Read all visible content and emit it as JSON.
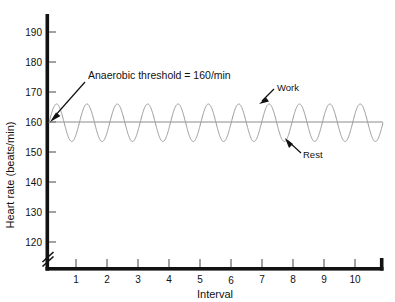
{
  "figure": {
    "background_color": "#ffffff",
    "width": 395,
    "height": 302,
    "truncated_title": ""
  },
  "chart_data": {
    "type": "line",
    "title": "",
    "xlabel": "Interval",
    "ylabel": "Heart rate (beats/min)",
    "xlim": [
      0,
      11
    ],
    "ylim": [
      115,
      195
    ],
    "y_axis_break": true,
    "y_axis_break_below": 120,
    "grid": false,
    "legend": false,
    "x_ticks": [
      1,
      2,
      3,
      4,
      5,
      6,
      7,
      8,
      9,
      10
    ],
    "x_tick_labels": [
      "1",
      "2",
      "3",
      "4",
      "5",
      "6",
      "7",
      "8",
      "9",
      "10"
    ],
    "y_ticks": [
      120,
      130,
      140,
      150,
      160,
      170,
      180,
      190
    ],
    "y_tick_labels": [
      "120",
      "130",
      "140",
      "150",
      "160",
      "170",
      "180",
      "190"
    ],
    "series": [
      {
        "name": "Heart rate during interval training",
        "type": "oscillating",
        "color": "#9a9a9a",
        "mean": 160,
        "peak_value": 166,
        "trough_value": 153.5,
        "cycles": 11,
        "description": "Sinusoidal heart rate alternating between work peaks (~166/min) and rest troughs (~153.5/min) around the 160/min anaerobic threshold"
      },
      {
        "name": "Anaerobic threshold",
        "type": "horizontal-reference",
        "color": "#8c8c8c",
        "value": 160
      }
    ],
    "annotations": [
      {
        "id": "threshold",
        "text": "Anaerobic threshold = 160/min",
        "points_to_value": 160,
        "arrow": true
      },
      {
        "id": "work",
        "text": "Work",
        "points_to_value": 166,
        "arrow": true
      },
      {
        "id": "rest",
        "text": "Rest",
        "points_to_value": 153.5,
        "arrow": true
      }
    ]
  },
  "axes": {
    "y_label": "Heart rate (beats/min)",
    "x_label": "Interval",
    "y_tick_labels": [
      "190",
      "180",
      "170",
      "160",
      "150",
      "140",
      "130",
      "120"
    ],
    "x_tick_labels": [
      "1",
      "2",
      "3",
      "4",
      "5",
      "6",
      "7",
      "8",
      "9",
      "10"
    ]
  },
  "annotations": {
    "threshold_label": "Anaerobic threshold = 160/min",
    "work_label": "Work",
    "rest_label": "Rest"
  },
  "colors": {
    "axis": "#121212",
    "curve": "#9a9a9a",
    "threshold": "#8c8c8c",
    "text": "#111111",
    "background": "#ffffff"
  }
}
